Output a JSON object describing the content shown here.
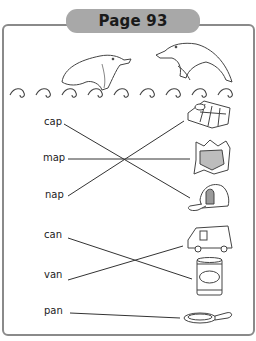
{
  "header": {
    "title": "Page 93"
  },
  "exercise": {
    "group1": {
      "words": [
        "cap",
        "map",
        "nap"
      ],
      "pictures": [
        "sleeping-bag",
        "map",
        "cap"
      ],
      "matches": [
        {
          "word": "cap",
          "picture": "cap"
        },
        {
          "word": "map",
          "picture": "map"
        },
        {
          "word": "nap",
          "picture": "sleeping-bag"
        }
      ]
    },
    "group2": {
      "words": [
        "can",
        "van",
        "pan"
      ],
      "pictures": [
        "van",
        "can",
        "pan"
      ],
      "matches": [
        {
          "word": "can",
          "picture": "can"
        },
        {
          "word": "van",
          "picture": "van"
        },
        {
          "word": "pan",
          "picture": "pan"
        }
      ]
    }
  },
  "colors": {
    "frame": "#8a8a8a",
    "tab": "#a8a8a8",
    "line": "#333333"
  }
}
